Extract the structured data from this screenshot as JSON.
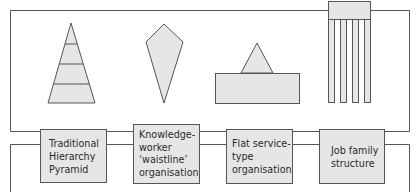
{
  "diagram": {
    "colors": {
      "line": "#555555",
      "fill": "#e6e6e6",
      "text": "#2a2a2a"
    },
    "structures": [
      {
        "id": "traditional-hierarchy-pyramid",
        "shape": "layered-triangle",
        "layers": 4,
        "label": "Traditional\nHierarchy\nPyramid"
      },
      {
        "id": "knowledge-worker-waistline",
        "shape": "kite-diamond",
        "label": "Knowledge-\nworker\n‘waistline’\norganisation"
      },
      {
        "id": "flat-service-type",
        "shape": "small-triangle-on-wide-rectangle",
        "label": "Flat service-\ntype\norganisation"
      },
      {
        "id": "job-family-structure",
        "shape": "header-with-vertical-columns",
        "columns": 4,
        "label": "Job family\nstructure"
      }
    ]
  }
}
